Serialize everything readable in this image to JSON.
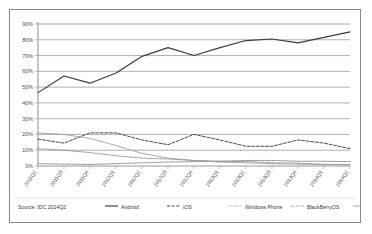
{
  "chart_data": {
    "type": "line",
    "title": "",
    "subtitle": "",
    "xlabel": "",
    "ylabel": "",
    "ylim": [
      0,
      90
    ],
    "ytick_labels": [
      "0%",
      "10%",
      "20%",
      "30%",
      "40%",
      "50%",
      "60%",
      "70%",
      "80%",
      "90%"
    ],
    "ytick_values": [
      0,
      10,
      20,
      30,
      40,
      50,
      60,
      70,
      80,
      90
    ],
    "grid": true,
    "legend_position": "bottom",
    "source_note": "Source: IDC,2014Q2",
    "categories": [
      "2011Q2",
      "2011Q3",
      "2011Q4",
      "2012Q1",
      "2012Q2",
      "2012Q3",
      "2012Q4",
      "2013Q1",
      "2013Q2",
      "2013Q3",
      "2013Q4",
      "2014Q1",
      "2014Q2"
    ],
    "series": [
      {
        "name": "Android",
        "style": "solid",
        "color": "#3a3a3a",
        "values": [
          46.5,
          57.0,
          52.5,
          59.0,
          69.5,
          75.0,
          70.0,
          75.0,
          79.5,
          80.5,
          78.0,
          81.5,
          85.0
        ]
      },
      {
        "name": "iOS",
        "style": "dashed",
        "color": "#4a4a4a",
        "values": [
          17.0,
          14.5,
          21.0,
          21.0,
          16.5,
          13.5,
          20.0,
          16.5,
          12.5,
          12.5,
          16.5,
          14.5,
          11.0
        ]
      },
      {
        "name": "Windows Phone",
        "style": "dotted",
        "color": "#7a7a7a",
        "values": [
          1.5,
          1.2,
          1.0,
          1.5,
          2.0,
          2.5,
          2.8,
          3.0,
          3.5,
          3.5,
          3.0,
          3.0,
          2.8
        ]
      },
      {
        "name": "BlackBerryOS",
        "style": "dash-dot",
        "color": "#8a8a8a",
        "values": [
          11.0,
          10.0,
          8.5,
          6.5,
          5.0,
          4.5,
          3.5,
          3.0,
          2.8,
          2.0,
          1.8,
          1.0,
          0.8
        ]
      },
      {
        "name": "Others",
        "style": "thin-solid",
        "color": "#9a9a9a",
        "values": [
          21.0,
          20.0,
          17.5,
          13.0,
          8.0,
          5.0,
          3.5,
          2.5,
          2.0,
          1.5,
          1.2,
          1.0,
          0.8
        ]
      }
    ]
  },
  "legend": {
    "items": [
      {
        "label": "Android"
      },
      {
        "label": "iOS"
      },
      {
        "label": "Windows Phone"
      },
      {
        "label": "BlackBerryOS"
      },
      {
        "label": "Others"
      }
    ]
  }
}
